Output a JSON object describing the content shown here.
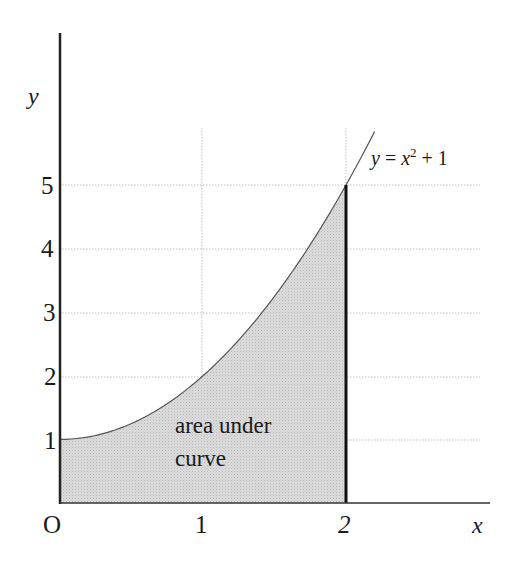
{
  "chart_data": {
    "type": "area",
    "title": "",
    "xlabel": "x",
    "ylabel": "y",
    "origin_label": "O",
    "xlim": [
      0,
      2.2
    ],
    "ylim": [
      0,
      6
    ],
    "x_ticks": [
      1,
      2
    ],
    "y_ticks": [
      1,
      2,
      3,
      4,
      5
    ],
    "x_tick_labels": [
      "1",
      "2"
    ],
    "y_tick_labels": [
      "1",
      "2",
      "3",
      "4",
      "5"
    ],
    "grid": true,
    "series": [
      {
        "name": "y = x^2 + 1",
        "function": "x^2 + 1",
        "x": [
          0,
          0.25,
          0.5,
          0.75,
          1,
          1.25,
          1.5,
          1.75,
          2,
          2.2
        ],
        "values": [
          1,
          1.0625,
          1.25,
          1.5625,
          2,
          2.5625,
          3.25,
          4.0625,
          5,
          5.84
        ]
      }
    ],
    "shaded_region": {
      "from_x": 0,
      "to_x": 2,
      "label": "area under curve"
    },
    "annotations": [
      {
        "text": "y = x² + 1",
        "at": [
          2.15,
          5.4
        ]
      },
      {
        "text": "area under curve",
        "at": [
          0.8,
          1.0
        ]
      }
    ],
    "colors": {
      "fill": "#d6d6d6",
      "curve": "#555555",
      "axis": "#222222",
      "grid": "#bdbdbd"
    }
  },
  "labels": {
    "y_axis": "y",
    "x_axis": "x",
    "origin": "O",
    "x1": "1",
    "x2": "2",
    "y1": "1",
    "y2": "2",
    "y3": "3",
    "y4": "4",
    "y5": "5",
    "eq_y": "y",
    "eq_eq": " = ",
    "eq_x": "x",
    "eq_exp": "2",
    "eq_rest": " + 1",
    "area_line1": "area under",
    "area_line2": "curve"
  }
}
